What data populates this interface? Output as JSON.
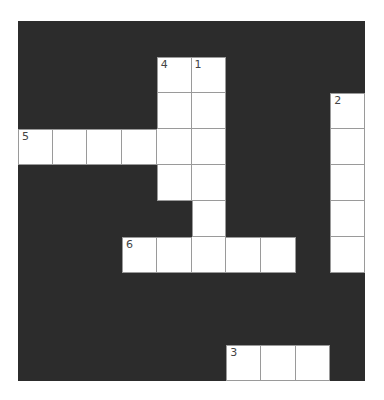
{
  "puzzle": {
    "rows": 10,
    "cols": 10,
    "colors": {
      "block": "#2c2c2c",
      "cell": "#ffffff",
      "gridline": "#9a9a9a",
      "number": "#444444"
    },
    "white_cells": [
      [
        1,
        4
      ],
      [
        1,
        5
      ],
      [
        2,
        4
      ],
      [
        2,
        5
      ],
      [
        2,
        9
      ],
      [
        3,
        0
      ],
      [
        3,
        1
      ],
      [
        3,
        2
      ],
      [
        3,
        3
      ],
      [
        3,
        4
      ],
      [
        3,
        5
      ],
      [
        3,
        9
      ],
      [
        4,
        4
      ],
      [
        4,
        5
      ],
      [
        4,
        9
      ],
      [
        5,
        5
      ],
      [
        5,
        9
      ],
      [
        6,
        3
      ],
      [
        6,
        4
      ],
      [
        6,
        5
      ],
      [
        6,
        6
      ],
      [
        6,
        7
      ],
      [
        6,
        9
      ],
      [
        9,
        6
      ],
      [
        9,
        7
      ],
      [
        9,
        8
      ]
    ],
    "numbers": [
      {
        "row": 1,
        "col": 4,
        "label": "4"
      },
      {
        "row": 1,
        "col": 5,
        "label": "1"
      },
      {
        "row": 2,
        "col": 9,
        "label": "2"
      },
      {
        "row": 3,
        "col": 0,
        "label": "5"
      },
      {
        "row": 6,
        "col": 3,
        "label": "6"
      },
      {
        "row": 9,
        "col": 6,
        "label": "3"
      }
    ],
    "entries": {
      "across": [
        {
          "number": "5",
          "row": 3,
          "col": 0,
          "length": 6
        },
        {
          "number": "6",
          "row": 6,
          "col": 3,
          "length": 5
        },
        {
          "number": "3",
          "row": 9,
          "col": 6,
          "length": 3
        }
      ],
      "down": [
        {
          "number": "4",
          "row": 1,
          "col": 4,
          "length": 4
        },
        {
          "number": "1",
          "row": 1,
          "col": 5,
          "length": 6
        },
        {
          "number": "2",
          "row": 2,
          "col": 9,
          "length": 5
        }
      ]
    }
  }
}
